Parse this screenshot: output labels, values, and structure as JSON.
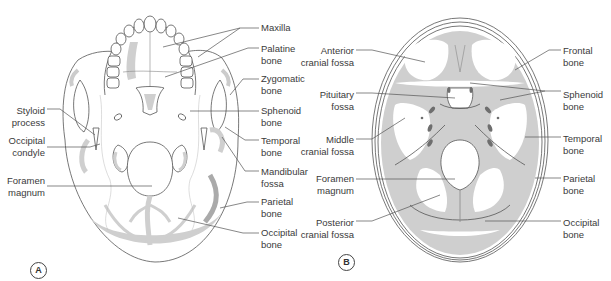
{
  "colors": {
    "line": "#555555",
    "bone_fill": "#cfcfcf",
    "dark_fill": "#6e6e6e",
    "text": "#3a3a3a",
    "background": "#ffffff"
  },
  "panels": [
    {
      "id": "A",
      "badge": "A",
      "view": "inferior view of skull",
      "labels": [
        {
          "key": "maxilla",
          "lines": [
            "Maxilla"
          ],
          "side": "right",
          "x": 261,
          "y": 22
        },
        {
          "key": "palatine",
          "lines": [
            "Palatine",
            "bone"
          ],
          "side": "right",
          "x": 261,
          "y": 43
        },
        {
          "key": "zygomatic",
          "lines": [
            "Zygomatic",
            "bone"
          ],
          "side": "right",
          "x": 261,
          "y": 73
        },
        {
          "key": "sphenoid",
          "lines": [
            "Sphenoid",
            "bone"
          ],
          "side": "right",
          "x": 261,
          "y": 105
        },
        {
          "key": "temporal",
          "lines": [
            "Temporal",
            "bone"
          ],
          "side": "right",
          "x": 261,
          "y": 135
        },
        {
          "key": "mandibular",
          "lines": [
            "Mandibular",
            "fossa"
          ],
          "side": "right",
          "x": 261,
          "y": 166
        },
        {
          "key": "parietal",
          "lines": [
            "Parietal",
            "bone"
          ],
          "side": "right",
          "x": 261,
          "y": 196
        },
        {
          "key": "occipital",
          "lines": [
            "Occipital",
            "bone"
          ],
          "side": "right",
          "x": 261,
          "y": 227
        },
        {
          "key": "styloid",
          "lines": [
            "Styloid",
            "process"
          ],
          "side": "left",
          "x": 45,
          "y": 105
        },
        {
          "key": "occ_condyle",
          "lines": [
            "Occipital",
            "condyle"
          ],
          "side": "left",
          "x": 45,
          "y": 135
        },
        {
          "key": "foramen",
          "lines": [
            "Foramen",
            "magnum"
          ],
          "side": "left",
          "x": 45,
          "y": 175
        }
      ]
    },
    {
      "id": "B",
      "badge": "B",
      "view": "internal view of cranial base",
      "labels": [
        {
          "key": "anterior_fossa",
          "lines": [
            "Anterior",
            "cranial fossa"
          ],
          "side": "left",
          "x": 354,
          "y": 45
        },
        {
          "key": "pituitary",
          "lines": [
            "Pituitary",
            "fossa"
          ],
          "side": "left",
          "x": 354,
          "y": 89
        },
        {
          "key": "middle_fossa",
          "lines": [
            "Middle",
            "cranial fossa"
          ],
          "side": "left",
          "x": 354,
          "y": 134
        },
        {
          "key": "foramen_b",
          "lines": [
            "Foramen",
            "magnum"
          ],
          "side": "left",
          "x": 354,
          "y": 173
        },
        {
          "key": "posterior_fossa",
          "lines": [
            "Posterior",
            "cranial fossa"
          ],
          "side": "left",
          "x": 354,
          "y": 217
        },
        {
          "key": "frontal",
          "lines": [
            "Frontal",
            "bone"
          ],
          "side": "right",
          "x": 563,
          "y": 45
        },
        {
          "key": "sphenoid_b",
          "lines": [
            "Sphenoid",
            "bone"
          ],
          "side": "right",
          "x": 563,
          "y": 89
        },
        {
          "key": "temporal_b",
          "lines": [
            "Temporal",
            "bone"
          ],
          "side": "right",
          "x": 563,
          "y": 133
        },
        {
          "key": "parietal_b",
          "lines": [
            "Parietal",
            "bone"
          ],
          "side": "right",
          "x": 563,
          "y": 173
        },
        {
          "key": "occipital_b",
          "lines": [
            "Occipital",
            "bone"
          ],
          "side": "right",
          "x": 563,
          "y": 217
        }
      ]
    }
  ],
  "leaders": [
    {
      "panel": "A",
      "label": "maxilla",
      "points": [
        [
          259,
          28
        ],
        [
          240,
          28
        ],
        [
          163,
          47
        ]
      ]
    },
    {
      "panel": "A",
      "label": "maxilla",
      "points": [
        [
          240,
          28
        ],
        [
          198,
          57
        ]
      ]
    },
    {
      "panel": "A",
      "label": "palatine",
      "points": [
        [
          259,
          48
        ],
        [
          248,
          48
        ],
        [
          165,
          77
        ]
      ]
    },
    {
      "panel": "A",
      "label": "zygomatic",
      "points": [
        [
          259,
          79
        ],
        [
          243,
          79
        ],
        [
          230,
          95
        ]
      ]
    },
    {
      "panel": "A",
      "label": "sphenoid",
      "points": [
        [
          259,
          111
        ],
        [
          190,
          111
        ]
      ]
    },
    {
      "panel": "A",
      "label": "temporal",
      "points": [
        [
          259,
          140
        ],
        [
          245,
          140
        ],
        [
          225,
          127
        ]
      ]
    },
    {
      "panel": "A",
      "label": "mandibular",
      "points": [
        [
          259,
          171
        ],
        [
          245,
          171
        ],
        [
          222,
          137
        ]
      ]
    },
    {
      "panel": "A",
      "label": "parietal",
      "points": [
        [
          259,
          202
        ],
        [
          247,
          202
        ],
        [
          220,
          208
        ]
      ]
    },
    {
      "panel": "A",
      "label": "occipital",
      "points": [
        [
          259,
          233
        ],
        [
          243,
          233
        ],
        [
          178,
          218
        ]
      ]
    },
    {
      "panel": "A",
      "label": "styloid",
      "points": [
        [
          47,
          109
        ],
        [
          60,
          109
        ],
        [
          95,
          135
        ]
      ]
    },
    {
      "panel": "A",
      "label": "occ_condyle",
      "points": [
        [
          47,
          147
        ],
        [
          90,
          147
        ],
        [
          100,
          144
        ]
      ]
    },
    {
      "panel": "A",
      "label": "foramen",
      "points": [
        [
          47,
          186
        ],
        [
          152,
          186
        ]
      ]
    },
    {
      "panel": "B",
      "label": "anterior_fossa",
      "points": [
        [
          356,
          50
        ],
        [
          372,
          50
        ],
        [
          425,
          62
        ]
      ]
    },
    {
      "panel": "B",
      "label": "pituitary",
      "points": [
        [
          356,
          93
        ],
        [
          372,
          93
        ],
        [
          455,
          98
        ]
      ]
    },
    {
      "panel": "B",
      "label": "middle_fossa",
      "points": [
        [
          356,
          139
        ],
        [
          372,
          139
        ],
        [
          405,
          118
        ]
      ]
    },
    {
      "panel": "B",
      "label": "foramen_b",
      "points": [
        [
          356,
          179
        ],
        [
          455,
          179
        ]
      ]
    },
    {
      "panel": "B",
      "label": "posterior_fossa",
      "points": [
        [
          356,
          221
        ],
        [
          372,
          221
        ],
        [
          440,
          195
        ]
      ]
    },
    {
      "panel": "B",
      "label": "frontal",
      "points": [
        [
          561,
          50
        ],
        [
          549,
          50
        ],
        [
          515,
          70
        ]
      ]
    },
    {
      "panel": "B",
      "label": "sphenoid_b",
      "points": [
        [
          561,
          91
        ],
        [
          545,
          91
        ],
        [
          470,
          83
        ]
      ]
    },
    {
      "panel": "B",
      "label": "sphenoid_b",
      "points": [
        [
          545,
          91
        ],
        [
          500,
          100
        ]
      ]
    },
    {
      "panel": "B",
      "label": "temporal_b",
      "points": [
        [
          561,
          137
        ],
        [
          525,
          137
        ]
      ]
    },
    {
      "panel": "B",
      "label": "parietal_b",
      "points": [
        [
          561,
          178
        ],
        [
          535,
          178
        ]
      ]
    },
    {
      "panel": "B",
      "label": "occipital_b",
      "points": [
        [
          561,
          221
        ],
        [
          485,
          221
        ]
      ]
    }
  ]
}
